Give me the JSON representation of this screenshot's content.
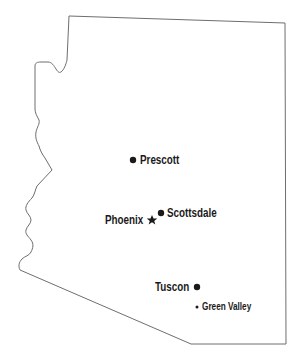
{
  "map": {
    "region": "Arizona",
    "outline_color": "#6e6e6e",
    "marker_color": "#1a1a1a",
    "cities": [
      {
        "name": "Prescott",
        "marker": "dot",
        "marker_x": 133,
        "marker_y": 160
      },
      {
        "name": "Phoenix",
        "marker": "star",
        "marker_x": 152,
        "marker_y": 220,
        "capital": true
      },
      {
        "name": "Scottsdale",
        "marker": "dot",
        "marker_x": 161,
        "marker_y": 213
      },
      {
        "name": "Tuscon",
        "marker": "dot",
        "marker_x": 197,
        "marker_y": 287
      },
      {
        "name": "Green Valley",
        "marker": "small-dot",
        "marker_x": 197,
        "marker_y": 307
      }
    ]
  }
}
